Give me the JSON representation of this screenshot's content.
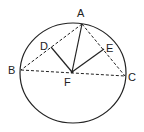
{
  "diagram": {
    "type": "geometry",
    "points": [
      {
        "id": "A",
        "label": "A"
      },
      {
        "id": "B",
        "label": "B"
      },
      {
        "id": "C",
        "label": "C"
      },
      {
        "id": "D",
        "label": "D"
      },
      {
        "id": "E",
        "label": "E"
      },
      {
        "id": "F",
        "label": "F"
      }
    ],
    "dashed_segments": [
      [
        "A",
        "B"
      ],
      [
        "A",
        "C"
      ],
      [
        "B",
        "C"
      ]
    ],
    "solid_segments": [
      [
        "F",
        "A"
      ],
      [
        "F",
        "D"
      ],
      [
        "F",
        "E"
      ]
    ],
    "colors": {
      "stroke": "#222222",
      "background": "#ffffff"
    }
  }
}
